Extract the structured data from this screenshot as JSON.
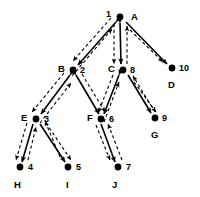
{
  "figure": {
    "width": 200,
    "height": 197,
    "background_color": "#ffffff",
    "ink_color": "#000000"
  },
  "nodes": [
    {
      "id": "A",
      "letter": "A",
      "number": "1",
      "x": 120,
      "y": 17,
      "letter_x": 131,
      "letter_y": 12,
      "number_x": 106,
      "number_y": 10
    },
    {
      "id": "B",
      "letter": "B",
      "number": "2",
      "x": 73,
      "y": 70,
      "letter_x": 58,
      "letter_y": 64,
      "number_x": 80,
      "number_y": 67
    },
    {
      "id": "C",
      "letter": "C",
      "number": "8",
      "x": 123,
      "y": 70,
      "letter_x": 108,
      "letter_y": 64,
      "number_x": 130,
      "number_y": 67
    },
    {
      "id": "D",
      "letter": "D",
      "number": "10",
      "x": 172,
      "y": 68,
      "letter_x": 168,
      "letter_y": 80,
      "number_x": 179,
      "number_y": 64
    },
    {
      "id": "E",
      "letter": "E",
      "number": "3",
      "x": 36,
      "y": 119,
      "letter_x": 21,
      "letter_y": 113,
      "number_x": 44,
      "number_y": 116
    },
    {
      "id": "F",
      "letter": "F",
      "number": "6",
      "x": 101,
      "y": 119,
      "letter_x": 87,
      "letter_y": 113,
      "number_x": 109,
      "number_y": 116
    },
    {
      "id": "G",
      "letter": "G",
      "number": "9",
      "x": 155,
      "y": 118,
      "letter_x": 151,
      "letter_y": 130,
      "number_x": 162,
      "number_y": 114
    },
    {
      "id": "H",
      "letter": "H",
      "number": "4",
      "x": 20,
      "y": 167,
      "letter_x": 14,
      "letter_y": 180,
      "number_x": 28,
      "number_y": 164
    },
    {
      "id": "I",
      "letter": "I",
      "number": "5",
      "x": 68,
      "y": 167,
      "letter_x": 65,
      "letter_y": 180,
      "number_x": 76,
      "number_y": 164
    },
    {
      "id": "J",
      "letter": "J",
      "number": "7",
      "x": 118,
      "y": 167,
      "letter_x": 112,
      "letter_y": 180,
      "number_x": 126,
      "number_y": 164
    }
  ],
  "edges": [
    {
      "from": "A",
      "to": "B",
      "style": "solid",
      "arrows": "both"
    },
    {
      "from": "A",
      "to": "C",
      "style": "solid",
      "arrows": "both"
    },
    {
      "from": "A",
      "to": "D",
      "style": "solid",
      "arrows": "forward"
    },
    {
      "from": "B",
      "to": "E",
      "style": "solid",
      "arrows": "both"
    },
    {
      "from": "B",
      "to": "F",
      "style": "solid",
      "arrows": "both"
    },
    {
      "from": "C",
      "to": "F",
      "style": "solid",
      "arrows": "both"
    },
    {
      "from": "C",
      "to": "G",
      "style": "solid",
      "arrows": "both"
    },
    {
      "from": "E",
      "to": "H",
      "style": "solid",
      "arrows": "both"
    },
    {
      "from": "E",
      "to": "I",
      "style": "solid",
      "arrows": "both"
    },
    {
      "from": "F",
      "to": "J",
      "style": "solid",
      "arrows": "both"
    },
    {
      "from": "A",
      "to": "B",
      "style": "dashed",
      "arrows": "both"
    },
    {
      "from": "A",
      "to": "C",
      "style": "dashed",
      "arrows": "both"
    },
    {
      "from": "A",
      "to": "D",
      "style": "dashed",
      "arrows": "forward"
    },
    {
      "from": "B",
      "to": "E",
      "style": "dashed",
      "arrows": "both"
    },
    {
      "from": "B",
      "to": "F",
      "style": "dashed",
      "arrows": "both"
    },
    {
      "from": "C",
      "to": "F",
      "style": "dashed",
      "arrows": "both"
    },
    {
      "from": "C",
      "to": "G",
      "style": "dashed",
      "arrows": "both"
    },
    {
      "from": "E",
      "to": "H",
      "style": "dashed",
      "arrows": "both"
    },
    {
      "from": "E",
      "to": "I",
      "style": "dashed",
      "arrows": "both"
    },
    {
      "from": "F",
      "to": "J",
      "style": "dashed",
      "arrows": "both"
    }
  ],
  "visit_order": [
    "1",
    "2",
    "3",
    "4",
    "5",
    "6",
    "7",
    "8",
    "9",
    "10"
  ]
}
